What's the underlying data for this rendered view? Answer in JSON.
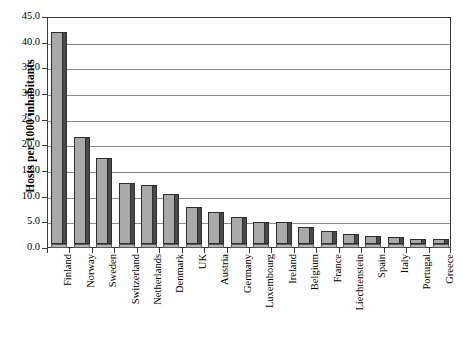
{
  "chart_data": {
    "type": "bar",
    "title": "",
    "xlabel": "",
    "ylabel": "Hosts per 1000 inhabitants",
    "ylim": [
      0.0,
      45.0
    ],
    "ytick_labels": [
      "45.0",
      "40.0",
      "35.0",
      "30.0",
      "25.0",
      "20.0",
      "15.0",
      "10.0",
      "5.0",
      "0.0"
    ],
    "ytick_values": [
      45.0,
      40.0,
      35.0,
      30.0,
      25.0,
      20.0,
      15.0,
      10.0,
      5.0,
      0.0
    ],
    "grid": true,
    "legend": "none",
    "categories": [
      "Finland",
      "Norway",
      "Sweden",
      "Switzerland",
      "Netherlands",
      "Denmark",
      "UK",
      "Austria",
      "Germany",
      "Luxembourg",
      "Ireland",
      "Belgium",
      "France",
      "Liechtenstein",
      "Spain",
      "Italy",
      "Portugal",
      "Greece"
    ],
    "values": [
      41.3,
      20.8,
      16.8,
      11.9,
      11.5,
      9.7,
      7.3,
      6.3,
      5.3,
      4.3,
      4.2,
      3.3,
      2.6,
      1.9,
      1.6,
      1.4,
      1.0,
      0.9
    ],
    "bar_style": "3d-column",
    "colors": {
      "bar_face": "#a9a9a9",
      "bar_top": "#3f3f3f",
      "bar_side": "#4a4a4a",
      "bar_outline": "#2e2e2e",
      "gridline": "#8c8c8c",
      "axis": "#3a3a3a",
      "background": "#ffffff",
      "text": "#000000"
    }
  }
}
